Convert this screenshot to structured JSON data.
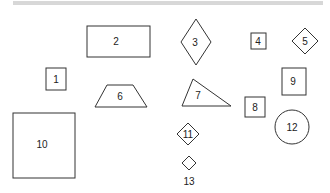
{
  "diagram": {
    "type": "numbered-shapes",
    "shapes": [
      {
        "id": "1",
        "label": "1",
        "kind": "rect",
        "x": 46,
        "y": 68,
        "w": 20,
        "h": 22
      },
      {
        "id": "2",
        "label": "2",
        "kind": "rect",
        "x": 87,
        "y": 26,
        "w": 63,
        "h": 31
      },
      {
        "id": "3",
        "label": "3",
        "kind": "diamond",
        "cx": 196,
        "cy": 42,
        "rx": 15,
        "ry": 23
      },
      {
        "id": "4",
        "label": "4",
        "kind": "rect",
        "x": 251,
        "y": 33,
        "w": 15,
        "h": 16
      },
      {
        "id": "5",
        "label": "5",
        "kind": "diamond",
        "cx": 305,
        "cy": 41,
        "rx": 13,
        "ry": 13
      },
      {
        "id": "6",
        "label": "6",
        "kind": "trapezoid",
        "points": "107,85 133,85 147,107 95,107"
      },
      {
        "id": "7",
        "label": "7",
        "kind": "triangle",
        "points": "193,79 231,106 182,106"
      },
      {
        "id": "8",
        "label": "8",
        "kind": "rect",
        "x": 245,
        "y": 97,
        "w": 20,
        "h": 20
      },
      {
        "id": "9",
        "label": "9",
        "kind": "rect",
        "x": 282,
        "y": 68,
        "w": 24,
        "h": 27
      },
      {
        "id": "10",
        "label": "10",
        "kind": "rect",
        "x": 13,
        "y": 113,
        "w": 62,
        "h": 65
      },
      {
        "id": "11",
        "label": "11",
        "kind": "diamond",
        "cx": 188,
        "cy": 134,
        "rx": 11,
        "ry": 11
      },
      {
        "id": "12",
        "label": "12",
        "kind": "circle",
        "cx": 292,
        "cy": 127,
        "r": 17
      },
      {
        "id": "13",
        "label": "13",
        "kind": "diamond",
        "cx": 189,
        "cy": 163,
        "rx": 7,
        "ry": 7,
        "label_below": true
      }
    ],
    "labels": {
      "1": {
        "x": 56,
        "y": 79
      },
      "2": {
        "x": 116,
        "y": 41
      },
      "3": {
        "x": 195,
        "y": 42
      },
      "4": {
        "x": 258,
        "y": 41
      },
      "5": {
        "x": 305,
        "y": 41
      },
      "6": {
        "x": 120,
        "y": 96
      },
      "7": {
        "x": 198,
        "y": 95
      },
      "8": {
        "x": 255,
        "y": 107
      },
      "9": {
        "x": 293,
        "y": 81
      },
      "10": {
        "x": 42,
        "y": 144
      },
      "11": {
        "x": 188,
        "y": 134
      },
      "12": {
        "x": 292,
        "y": 127
      },
      "13": {
        "x": 189,
        "y": 181
      }
    }
  }
}
